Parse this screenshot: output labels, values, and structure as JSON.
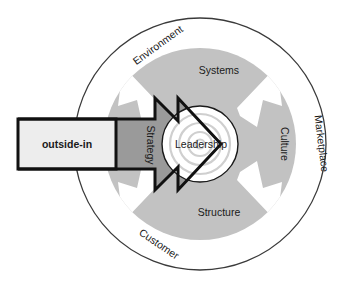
{
  "diagram": {
    "type": "concentric-circle-diagram",
    "outer_ring": {
      "name": "outer-context-ring",
      "labels": [
        {
          "key": "environment",
          "text": "Environment",
          "position": "upper-left-arc"
        },
        {
          "key": "marketplace",
          "text": "Marketplace",
          "position": "right-arc"
        },
        {
          "key": "customer",
          "text": "Customer",
          "position": "lower-left-arc"
        }
      ]
    },
    "middle_ring": {
      "name": "organizational-elements-ring",
      "labels": [
        {
          "key": "systems",
          "text": "Systems",
          "position": "top"
        },
        {
          "key": "culture",
          "text": "Culture",
          "position": "right"
        },
        {
          "key": "structure",
          "text": "Structure",
          "position": "bottom"
        },
        {
          "key": "strategy",
          "text": "Strategy",
          "position": "left"
        }
      ]
    },
    "core": {
      "name": "core-circle",
      "label": "Leadership"
    },
    "input_box": {
      "label": "outside-in"
    },
    "arrow": {
      "name": "inward-arrow",
      "direction": "right",
      "meaning": "outside-in force driving toward leadership"
    },
    "colors": {
      "page_background": "#ffffff",
      "outer_ring_fill": "#ffffff",
      "outer_ring_stroke": "#333333",
      "middle_ring_fill": "#c2c2c2",
      "arrow_overlay_fill": "#9a9a9a",
      "core_fill": "#ffffff",
      "core_stroke": "#1a1a1a",
      "core_ring_stroke": "#cfcfcf",
      "wedge_fill": "#ffffff",
      "box_fill": "#ededed",
      "box_stroke": "#111111",
      "arrow_stroke": "#111111",
      "text_color": "#1a1a1a"
    },
    "geometry": {
      "center_x": 200,
      "center_y": 144,
      "outer_radius": 126,
      "middle_outer_radius": 96,
      "core_radius": 38
    }
  }
}
